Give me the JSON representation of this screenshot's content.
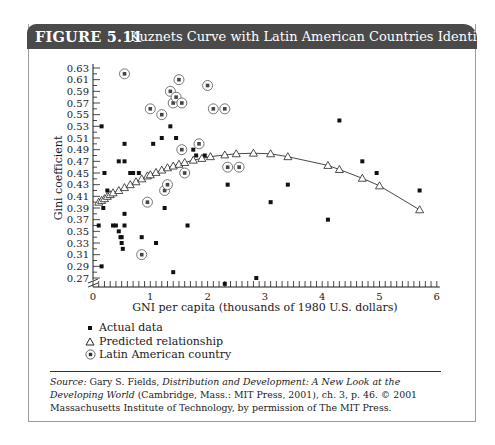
{
  "figure": {
    "number": "FIGURE 5.11",
    "title": "Kuznets Curve with Latin American Countries Identified"
  },
  "legend": {
    "items": [
      {
        "symbol": "filled-square",
        "label": "Actual data"
      },
      {
        "symbol": "open-triangle",
        "label": "Predicted relationship"
      },
      {
        "symbol": "circled-square",
        "label": "Latin American country"
      }
    ]
  },
  "caption": {
    "source_label": "Source:",
    "author": " Gary S. Fields, ",
    "book_title": "Distribution and Development: A New Look at the Developing World",
    "rest": " (Cambridge, Mass.: MIT Press, 2001), ch. 3, p. 46. © 2001 Massachusetts Institute of Technology, by permission of The MIT Press."
  },
  "colors": {
    "header_bg": "#4a4a4a",
    "header_text": "#ffffff",
    "frame_border": "#9a9a9a",
    "ink": "#1a1a1a"
  },
  "chart_data": {
    "type": "scatter",
    "title": "Kuznets Curve with Latin American Countries Identified",
    "xlabel": "GNI per capita (thousands of 1980 U.S. dollars)",
    "ylabel": "Gini coefficient",
    "xlim": [
      0,
      6
    ],
    "ylim": [
      0.27,
      0.63
    ],
    "x_ticks": [
      0,
      1,
      2,
      3,
      4,
      5,
      6
    ],
    "y_ticks": [
      "0.63",
      "0.61",
      "0.59",
      "0.57",
      "0.55",
      "0.53",
      "0.51",
      "0.49",
      "0.47",
      "0.45",
      "0.43",
      "0.41",
      "0.39",
      "0.37",
      "0.35",
      "0.33",
      "0.31",
      "0.29",
      "0.27"
    ],
    "grid": false,
    "legend_position": "below-left",
    "axis_break": true,
    "series": [
      {
        "name": "Actual data",
        "marker": "filled-square",
        "points": [
          [
            0.15,
            0.53
          ],
          [
            0.2,
            0.45
          ],
          [
            0.25,
            0.42
          ],
          [
            0.1,
            0.36
          ],
          [
            0.18,
            0.39
          ],
          [
            0.15,
            0.29
          ],
          [
            0.35,
            0.36
          ],
          [
            0.4,
            0.36
          ],
          [
            0.45,
            0.35
          ],
          [
            0.48,
            0.34
          ],
          [
            0.5,
            0.34
          ],
          [
            0.5,
            0.33
          ],
          [
            0.52,
            0.32
          ],
          [
            0.55,
            0.36
          ],
          [
            0.55,
            0.38
          ],
          [
            0.45,
            0.47
          ],
          [
            0.55,
            0.47
          ],
          [
            0.55,
            0.5
          ],
          [
            0.65,
            0.45
          ],
          [
            0.7,
            0.45
          ],
          [
            0.8,
            0.45
          ],
          [
            0.85,
            0.34
          ],
          [
            1.1,
            0.33
          ],
          [
            1.05,
            0.5
          ],
          [
            1.2,
            0.51
          ],
          [
            1.35,
            0.53
          ],
          [
            1.45,
            0.51
          ],
          [
            1.75,
            0.49
          ],
          [
            1.8,
            0.48
          ],
          [
            1.25,
            0.39
          ],
          [
            1.4,
            0.28
          ],
          [
            1.65,
            0.36
          ],
          [
            1.95,
            0.48
          ],
          [
            2.35,
            0.43
          ],
          [
            2.3,
            0.26
          ],
          [
            2.85,
            0.27
          ],
          [
            3.1,
            0.4
          ],
          [
            3.4,
            0.43
          ],
          [
            4.1,
            0.37
          ],
          [
            4.3,
            0.54
          ],
          [
            4.7,
            0.47
          ],
          [
            4.95,
            0.45
          ],
          [
            5.7,
            0.42
          ]
        ]
      },
      {
        "name": "Predicted relationship",
        "marker": "open-triangle",
        "points": [
          [
            0.1,
            0.4
          ],
          [
            0.15,
            0.403
          ],
          [
            0.2,
            0.406
          ],
          [
            0.25,
            0.41
          ],
          [
            0.3,
            0.413
          ],
          [
            0.35,
            0.416
          ],
          [
            0.45,
            0.42
          ],
          [
            0.55,
            0.425
          ],
          [
            0.65,
            0.43
          ],
          [
            0.75,
            0.435
          ],
          [
            0.85,
            0.44
          ],
          [
            0.95,
            0.445
          ],
          [
            1.0,
            0.447
          ],
          [
            1.1,
            0.451
          ],
          [
            1.2,
            0.455
          ],
          [
            1.3,
            0.459
          ],
          [
            1.4,
            0.462
          ],
          [
            1.5,
            0.465
          ],
          [
            1.6,
            0.468
          ],
          [
            1.75,
            0.472
          ],
          [
            1.9,
            0.475
          ],
          [
            2.05,
            0.478
          ],
          [
            2.3,
            0.481
          ],
          [
            2.5,
            0.483
          ],
          [
            2.8,
            0.484
          ],
          [
            3.1,
            0.483
          ],
          [
            3.4,
            0.478
          ],
          [
            4.1,
            0.463
          ],
          [
            4.3,
            0.456
          ],
          [
            4.7,
            0.441
          ],
          [
            5.0,
            0.428
          ],
          [
            5.7,
            0.387
          ]
        ]
      },
      {
        "name": "Latin American country",
        "marker": "circled-square",
        "points": [
          [
            0.55,
            0.62
          ],
          [
            0.85,
            0.31
          ],
          [
            0.95,
            0.4
          ],
          [
            1.0,
            0.56
          ],
          [
            1.2,
            0.55
          ],
          [
            1.25,
            0.42
          ],
          [
            1.3,
            0.43
          ],
          [
            1.35,
            0.59
          ],
          [
            1.4,
            0.57
          ],
          [
            1.45,
            0.58
          ],
          [
            1.55,
            0.57
          ],
          [
            1.5,
            0.61
          ],
          [
            1.55,
            0.49
          ],
          [
            1.6,
            0.45
          ],
          [
            1.85,
            0.5
          ],
          [
            2.0,
            0.6
          ],
          [
            2.1,
            0.56
          ],
          [
            2.3,
            0.56
          ],
          [
            2.35,
            0.46
          ],
          [
            2.55,
            0.46
          ]
        ]
      }
    ]
  }
}
